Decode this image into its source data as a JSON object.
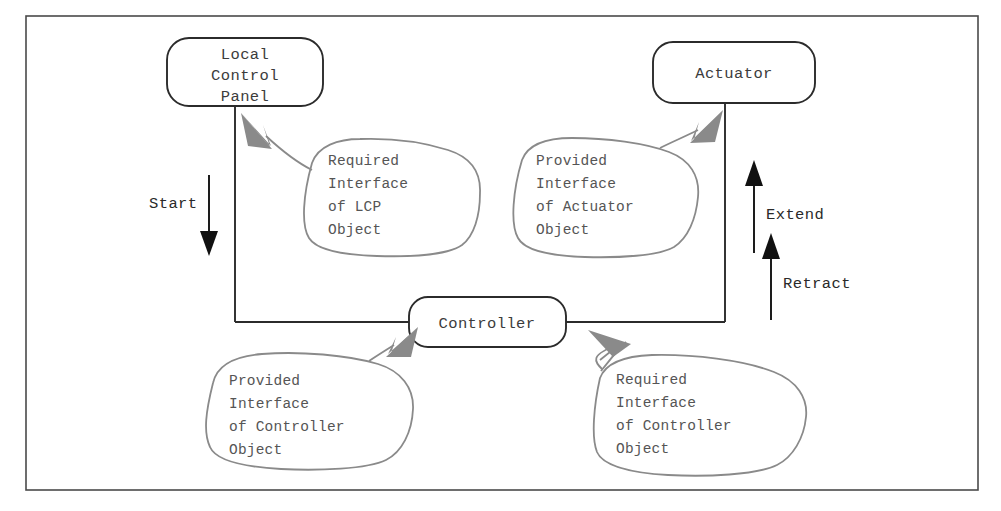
{
  "diagram": {
    "frame": {
      "stroke": "#4a4a4a"
    },
    "colors": {
      "node_stroke": "#2b2b2b",
      "node_fill": "#ffffff",
      "node_text": "#3c3c3c",
      "callout_stroke": "#8a8a8a",
      "callout_text": "#555555",
      "callout_arrow": "#8a8a8a",
      "flow_line": "#2b2b2b",
      "flow_arrow": "#111111",
      "flow_label": "#2a2a2a",
      "background": "#ffffff"
    },
    "nodes": [
      {
        "id": "local-control-panel",
        "name": "node-local-control-panel",
        "lines": [
          "Local",
          "Control",
          "Panel"
        ],
        "shape": "rounded-rectangle"
      },
      {
        "id": "actuator",
        "name": "node-actuator",
        "lines": [
          "Actuator"
        ],
        "shape": "rounded-rectangle"
      },
      {
        "id": "controller",
        "name": "node-controller",
        "lines": [
          "Controller"
        ],
        "shape": "rounded-rectangle"
      }
    ],
    "callouts": [
      {
        "id": "required-interface-lcp",
        "name": "callout-required-interface-of-lcp-object",
        "lines": [
          "Required",
          "Interface",
          "of LCP",
          "Object"
        ],
        "points_to": "local-control-panel"
      },
      {
        "id": "provided-interface-actuator",
        "name": "callout-provided-interface-of-actuator-object",
        "lines": [
          "Provided",
          "Interface",
          "of Actuator",
          "Object"
        ],
        "points_to": "actuator"
      },
      {
        "id": "provided-interface-controller",
        "name": "callout-provided-interface-of-controller-object",
        "lines": [
          "Provided",
          "Interface",
          "of Controller",
          "Object"
        ],
        "points_to": "controller"
      },
      {
        "id": "required-interface-controller",
        "name": "callout-required-interface-of-controller-object",
        "lines": [
          "Required",
          "Interface",
          "of Controller",
          "Object"
        ],
        "points_to": "controller"
      }
    ],
    "flow_labels": [
      {
        "id": "start",
        "name": "flow-label-start",
        "text": "Start",
        "direction": "down"
      },
      {
        "id": "extend",
        "name": "flow-label-extend",
        "text": "Extend",
        "direction": "up"
      },
      {
        "id": "retract",
        "name": "flow-label-retract",
        "text": "Retract",
        "direction": "up"
      }
    ]
  }
}
